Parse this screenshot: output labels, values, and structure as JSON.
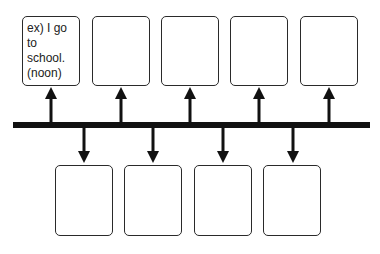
{
  "diagram": {
    "type": "timeline",
    "top_boxes": [
      {
        "text": "ex) I go to school. (noon)"
      },
      {
        "text": ""
      },
      {
        "text": ""
      },
      {
        "text": ""
      },
      {
        "text": ""
      }
    ],
    "bottom_boxes": [
      {
        "text": ""
      },
      {
        "text": ""
      },
      {
        "text": ""
      },
      {
        "text": ""
      }
    ]
  }
}
